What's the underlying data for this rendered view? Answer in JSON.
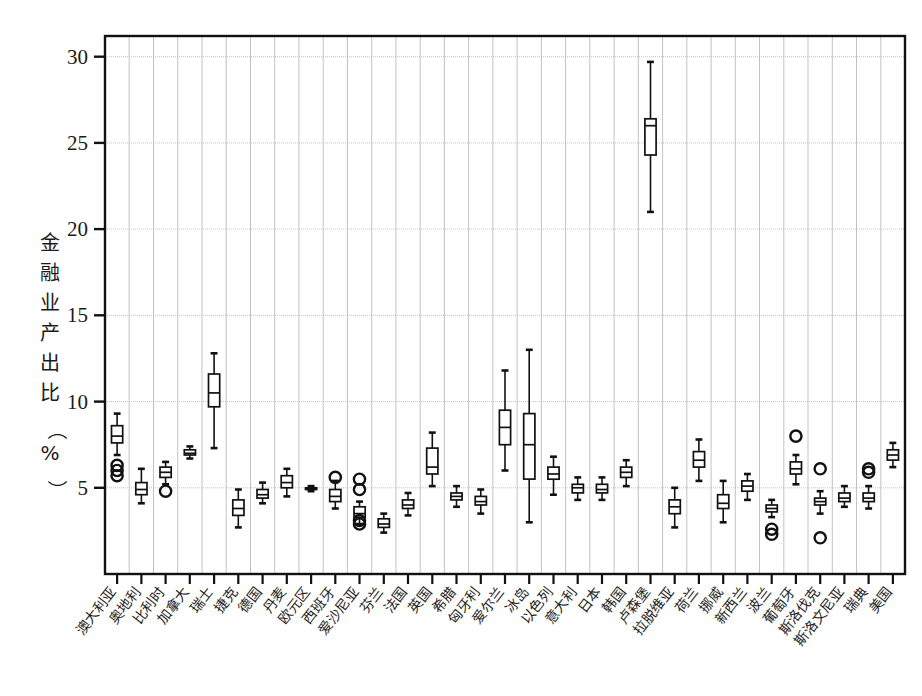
{
  "chart_data": {
    "type": "box",
    "title": "",
    "xlabel": "",
    "ylabel": "金融业产出比（%）",
    "ylabel_chars": [
      "金",
      "融",
      "业",
      "产",
      "出",
      "比",
      "（",
      "%",
      "）"
    ],
    "ylim": [
      0,
      31.2
    ],
    "ytick_values": [
      5,
      10,
      15,
      20,
      25,
      30
    ],
    "ytick_labels": [
      "5",
      "10",
      "15",
      "20",
      "25",
      "30"
    ],
    "grid": {
      "vertical": true,
      "horizontal": true,
      "color": "#b4b4b4"
    },
    "legend": {
      "show": false,
      "position": "none"
    },
    "categories": [
      "澳大利亚",
      "奥地利",
      "比利时",
      "加拿大",
      "瑞士",
      "捷克",
      "德国",
      "丹麦",
      "欧元区",
      "西班牙",
      "爱沙尼亚",
      "芬兰",
      "法国",
      "英国",
      "希腊",
      "匈牙利",
      "爱尔兰",
      "冰岛",
      "以色列",
      "意大利",
      "日本",
      "韩国",
      "卢森堡",
      "拉脱维亚",
      "荷兰",
      "挪威",
      "新西兰",
      "波兰",
      "葡萄牙",
      "斯洛伐克",
      "斯洛文尼亚",
      "瑞典",
      "美国"
    ],
    "series_name": "金融业产出比",
    "boxes": [
      {
        "category": "澳大利亚",
        "whisker_low": 6.9,
        "q1": 7.6,
        "median": 8.0,
        "q3": 8.6,
        "whisker_high": 9.3,
        "outliers": [
          6.3,
          6.0,
          5.7
        ]
      },
      {
        "category": "奥地利",
        "whisker_low": 4.1,
        "q1": 4.6,
        "median": 4.9,
        "q3": 5.3,
        "whisker_high": 6.1,
        "outliers": []
      },
      {
        "category": "比利时",
        "whisker_low": 5.2,
        "q1": 5.6,
        "median": 5.9,
        "q3": 6.2,
        "whisker_high": 6.5,
        "outliers": [
          4.8
        ]
      },
      {
        "category": "加拿大",
        "whisker_low": 6.7,
        "q1": 6.9,
        "median": 7.0,
        "q3": 7.2,
        "whisker_high": 7.4,
        "outliers": []
      },
      {
        "category": "瑞士",
        "whisker_low": 7.3,
        "q1": 9.7,
        "median": 10.5,
        "q3": 11.6,
        "whisker_high": 12.8,
        "outliers": []
      },
      {
        "category": "捷克",
        "whisker_low": 2.7,
        "q1": 3.4,
        "median": 3.8,
        "q3": 4.3,
        "whisker_high": 4.9,
        "outliers": []
      },
      {
        "category": "德国",
        "whisker_low": 4.1,
        "q1": 4.4,
        "median": 4.6,
        "q3": 4.9,
        "whisker_high": 5.3,
        "outliers": []
      },
      {
        "category": "丹麦",
        "whisker_low": 4.5,
        "q1": 5.0,
        "median": 5.3,
        "q3": 5.7,
        "whisker_high": 6.1,
        "outliers": []
      },
      {
        "category": "欧元区",
        "whisker_low": 4.8,
        "q1": 4.9,
        "median": 5.0,
        "q3": 5.0,
        "whisker_high": 5.1,
        "outliers": []
      },
      {
        "category": "西班牙",
        "whisker_low": 3.8,
        "q1": 4.2,
        "median": 4.5,
        "q3": 4.9,
        "whisker_high": 5.4,
        "outliers": [
          5.6
        ]
      },
      {
        "category": "爱沙尼亚",
        "whisker_low": 2.9,
        "q1": 3.3,
        "median": 3.5,
        "q3": 3.9,
        "whisker_high": 4.2,
        "outliers": [
          5.5,
          4.9,
          3.1,
          2.9
        ]
      },
      {
        "category": "芬兰",
        "whisker_low": 2.4,
        "q1": 2.7,
        "median": 2.9,
        "q3": 3.2,
        "whisker_high": 3.5,
        "outliers": []
      },
      {
        "category": "法国",
        "whisker_low": 3.4,
        "q1": 3.8,
        "median": 4.0,
        "q3": 4.3,
        "whisker_high": 4.7,
        "outliers": []
      },
      {
        "category": "英国",
        "whisker_low": 5.1,
        "q1": 5.8,
        "median": 6.2,
        "q3": 7.3,
        "whisker_high": 8.2,
        "outliers": []
      },
      {
        "category": "希腊",
        "whisker_low": 3.9,
        "q1": 4.3,
        "median": 4.5,
        "q3": 4.7,
        "whisker_high": 5.1,
        "outliers": []
      },
      {
        "category": "匈牙利",
        "whisker_low": 3.5,
        "q1": 4.0,
        "median": 4.2,
        "q3": 4.5,
        "whisker_high": 4.9,
        "outliers": []
      },
      {
        "category": "爱尔兰",
        "whisker_low": 6.0,
        "q1": 7.5,
        "median": 8.5,
        "q3": 9.5,
        "whisker_high": 11.8,
        "outliers": []
      },
      {
        "category": "冰岛",
        "whisker_low": 3.0,
        "q1": 5.5,
        "median": 7.5,
        "q3": 9.3,
        "whisker_high": 13.0,
        "outliers": []
      },
      {
        "category": "以色列",
        "whisker_low": 4.6,
        "q1": 5.5,
        "median": 5.8,
        "q3": 6.2,
        "whisker_high": 6.8,
        "outliers": []
      },
      {
        "category": "意大利",
        "whisker_low": 4.3,
        "q1": 4.7,
        "median": 5.0,
        "q3": 5.2,
        "whisker_high": 5.6,
        "outliers": []
      },
      {
        "category": "日本",
        "whisker_low": 4.3,
        "q1": 4.7,
        "median": 4.9,
        "q3": 5.2,
        "whisker_high": 5.6,
        "outliers": []
      },
      {
        "category": "韩国",
        "whisker_low": 5.1,
        "q1": 5.6,
        "median": 5.9,
        "q3": 6.2,
        "whisker_high": 6.6,
        "outliers": []
      },
      {
        "category": "卢森堡",
        "whisker_low": 21.0,
        "q1": 24.3,
        "median": 26.0,
        "q3": 26.4,
        "whisker_high": 29.7,
        "outliers": []
      },
      {
        "category": "拉脱维亚",
        "whisker_low": 2.7,
        "q1": 3.5,
        "median": 3.9,
        "q3": 4.3,
        "whisker_high": 5.0,
        "outliers": []
      },
      {
        "category": "荷兰",
        "whisker_low": 5.4,
        "q1": 6.2,
        "median": 6.6,
        "q3": 7.1,
        "whisker_high": 7.8,
        "outliers": []
      },
      {
        "category": "挪威",
        "whisker_low": 3.0,
        "q1": 3.8,
        "median": 4.1,
        "q3": 4.6,
        "whisker_high": 5.4,
        "outliers": []
      },
      {
        "category": "新西兰",
        "whisker_low": 4.3,
        "q1": 4.8,
        "median": 5.1,
        "q3": 5.4,
        "whisker_high": 5.8,
        "outliers": []
      },
      {
        "category": "波兰",
        "whisker_low": 3.3,
        "q1": 3.6,
        "median": 3.8,
        "q3": 4.0,
        "whisker_high": 4.3,
        "outliers": [
          2.6,
          2.3
        ]
      },
      {
        "category": "葡萄牙",
        "whisker_low": 5.2,
        "q1": 5.8,
        "median": 6.1,
        "q3": 6.5,
        "whisker_high": 6.9,
        "outliers": [
          8.0
        ]
      },
      {
        "category": "斯洛伐克",
        "whisker_low": 3.5,
        "q1": 4.0,
        "median": 4.2,
        "q3": 4.4,
        "whisker_high": 4.8,
        "outliers": [
          6.1,
          2.1
        ]
      },
      {
        "category": "斯洛文尼亚",
        "whisker_low": 3.9,
        "q1": 4.2,
        "median": 4.4,
        "q3": 4.7,
        "whisker_high": 5.1,
        "outliers": []
      },
      {
        "category": "瑞典",
        "whisker_low": 3.8,
        "q1": 4.2,
        "median": 4.4,
        "q3": 4.7,
        "whisker_high": 5.1,
        "outliers": [
          6.1,
          5.9
        ]
      },
      {
        "category": "美国",
        "whisker_low": 6.2,
        "q1": 6.6,
        "median": 6.9,
        "q3": 7.2,
        "whisker_high": 7.6,
        "outliers": []
      }
    ]
  }
}
